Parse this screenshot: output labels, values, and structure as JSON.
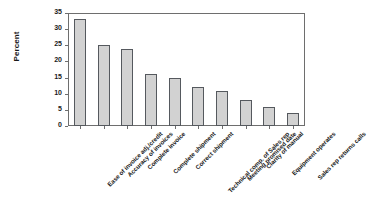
{
  "chart_data": {
    "type": "bar",
    "title": "",
    "subtitle": "",
    "xlabel": "",
    "ylabel": "Percent",
    "ylim": [
      0,
      35
    ],
    "yticks": [
      0,
      5,
      10,
      15,
      20,
      25,
      30,
      35
    ],
    "grid": false,
    "legend": null,
    "orientation": "vertical",
    "sorted": "descending",
    "categories": [
      "Ease of invoice adj./credit",
      "Accuracy of invoices",
      "Complete invoice",
      "Complete shipment",
      "Correct shipment",
      "Technical comp. of Sales rep",
      "Meeting promised date",
      "Clarity of manual",
      "Equipment operates",
      "Sales rep returns calls"
    ],
    "values": [
      33,
      25,
      24,
      16,
      15,
      12,
      11,
      8,
      6,
      4
    ],
    "series": [
      {
        "name": "Percent",
        "values": [
          33,
          25,
          24,
          16,
          15,
          12,
          11,
          8,
          6,
          4
        ]
      }
    ],
    "colors": {
      "bar_fill": "#d2d2d2",
      "bar_pattern": "#9a9a9a",
      "bar_border": "#55595e",
      "axis": "#6e6e6e",
      "text": "#1a1a1a",
      "background": "#ffffff"
    }
  }
}
